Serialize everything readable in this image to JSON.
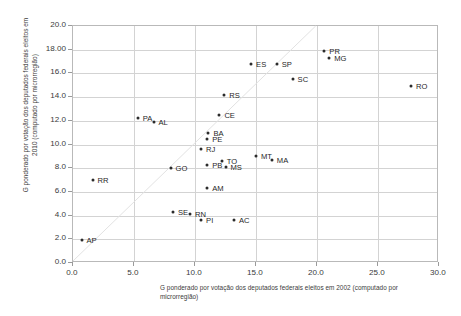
{
  "chart_data": {
    "type": "scatter",
    "title": "",
    "xlabel": "G ponderado por votação dos deputados federais eleitos em 2002 (computado por microrregião)",
    "ylabel": "G ponderado por votação dos deputados federais eleitos em 2010 (computado por microrregião)",
    "xlim": [
      0.0,
      30.0
    ],
    "ylim": [
      0.0,
      20.0
    ],
    "grid": true,
    "legend": "none",
    "xticks": [
      "0.0",
      "5.0",
      "10.0",
      "15.0",
      "20.0",
      "25.0",
      "30.0"
    ],
    "xtick_values": [
      0.0,
      5.0,
      10.0,
      15.0,
      20.0,
      25.0,
      30.0
    ],
    "yticks": [
      "0.0",
      "2.0",
      "4.0",
      "6.0",
      "8.0",
      "10.0",
      "12.0",
      "14.0",
      "16.0",
      "18.00",
      "20.0"
    ],
    "ytick_values": [
      0.0,
      2.0,
      4.0,
      6.0,
      8.0,
      10.0,
      12.0,
      14.0,
      16.0,
      18.0,
      20.0
    ],
    "reference_line": {
      "type": "diagonal",
      "from": [
        0.0,
        0.0
      ],
      "to": [
        20.0,
        20.0
      ]
    },
    "points": [
      {
        "label": "AP",
        "x": 0.7,
        "y": 1.9,
        "lx": 5,
        "ly": 0
      },
      {
        "label": "RR",
        "x": 1.6,
        "y": 7.0,
        "lx": 5,
        "ly": 0
      },
      {
        "label": "SE",
        "x": 8.2,
        "y": 4.3,
        "lx": 5,
        "ly": 0
      },
      {
        "label": "RN",
        "x": 9.6,
        "y": 4.1,
        "lx": 5,
        "ly": 0
      },
      {
        "label": "PI",
        "x": 10.5,
        "y": 3.6,
        "lx": 5,
        "ly": 0
      },
      {
        "label": "AC",
        "x": 13.2,
        "y": 3.6,
        "lx": 5,
        "ly": 0
      },
      {
        "label": "AM",
        "x": 11.0,
        "y": 6.3,
        "lx": 5,
        "ly": 0
      },
      {
        "label": "GO",
        "x": 8.0,
        "y": 8.0,
        "lx": 5,
        "ly": 0
      },
      {
        "label": "PB",
        "x": 11.0,
        "y": 8.3,
        "lx": 5,
        "ly": 0
      },
      {
        "label": "TO",
        "x": 12.2,
        "y": 8.6,
        "lx": 5,
        "ly": 0
      },
      {
        "label": "MS",
        "x": 12.5,
        "y": 8.1,
        "lx": 5,
        "ly": 0
      },
      {
        "label": "MT",
        "x": 15.0,
        "y": 9.0,
        "lx": 5,
        "ly": 0
      },
      {
        "label": "MA",
        "x": 16.3,
        "y": 8.7,
        "lx": 5,
        "ly": 0
      },
      {
        "label": "RJ",
        "x": 10.5,
        "y": 9.6,
        "lx": 5,
        "ly": 0
      },
      {
        "label": "BA",
        "x": 11.1,
        "y": 11.0,
        "lx": 5,
        "ly": 0
      },
      {
        "label": "PE",
        "x": 11.0,
        "y": 10.5,
        "lx": 5,
        "ly": 0
      },
      {
        "label": "PA",
        "x": 5.3,
        "y": 12.2,
        "lx": 5,
        "ly": 0
      },
      {
        "label": "AL",
        "x": 6.6,
        "y": 11.9,
        "lx": 5,
        "ly": 0
      },
      {
        "label": "CE",
        "x": 12.0,
        "y": 12.5,
        "lx": 5,
        "ly": 0
      },
      {
        "label": "RS",
        "x": 12.4,
        "y": 14.2,
        "lx": 5,
        "ly": 0
      },
      {
        "label": "SC",
        "x": 18.0,
        "y": 15.5,
        "lx": 5,
        "ly": 0
      },
      {
        "label": "RO",
        "x": 27.7,
        "y": 14.9,
        "lx": 5,
        "ly": 0
      },
      {
        "label": "ES",
        "x": 14.6,
        "y": 16.8,
        "lx": 5,
        "ly": 0
      },
      {
        "label": "SP",
        "x": 16.7,
        "y": 16.8,
        "lx": 5,
        "ly": 0
      },
      {
        "label": "PR",
        "x": 20.6,
        "y": 17.9,
        "lx": 5,
        "ly": 0
      },
      {
        "label": "MG",
        "x": 21.0,
        "y": 17.3,
        "lx": 5,
        "ly": 0
      }
    ]
  },
  "style": {
    "point_color": "#2b2b2b",
    "grid_color": "#d3d3d3",
    "frame_color": "#b9b9b9",
    "text_color": "#3b3b3b",
    "background": "#ffffff"
  }
}
